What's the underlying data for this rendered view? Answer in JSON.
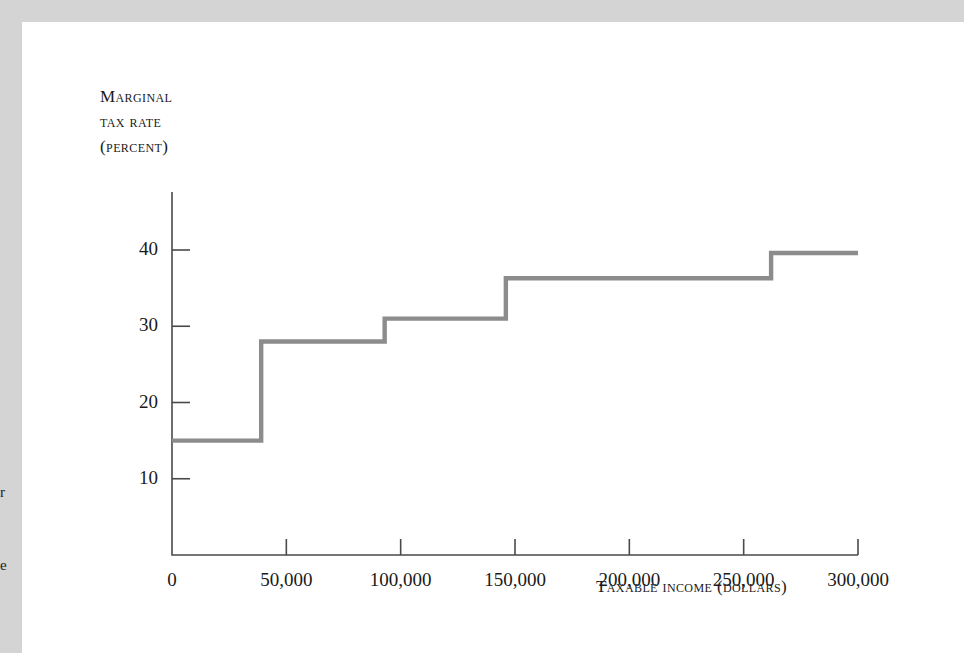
{
  "figure": {
    "background_color": "#ffffff",
    "margin_color": "#d4d4d4",
    "line_color": "#8c8c8c",
    "axis_color": "#4a4a4a"
  },
  "margin_fragments": {
    "fragment_one": "r",
    "fragment_two": "e"
  },
  "chart_data": {
    "type": "line",
    "line_style": "step-post",
    "title": "",
    "xlabel": "Taxable income (dollars)",
    "ylabel": "Marginal tax rate (percent)",
    "ylabel_lines": [
      "Marginal",
      "tax rate",
      "(percent)"
    ],
    "xlim": [
      0,
      300000
    ],
    "ylim": [
      0,
      42
    ],
    "grid": false,
    "legend": null,
    "xticks": [
      0,
      50000,
      100000,
      150000,
      200000,
      250000,
      300000
    ],
    "xtick_labels": [
      "0",
      "50,000",
      "100,000",
      "150,000",
      "200,000",
      "250,000",
      "300,000"
    ],
    "yticks": [
      10,
      20,
      30,
      40
    ],
    "ytick_labels": [
      "10",
      "20",
      "30",
      "40"
    ],
    "x": [
      0,
      39000,
      39000,
      93000,
      93000,
      146000,
      146000,
      262000,
      262000,
      300000
    ],
    "y": [
      15,
      15,
      28,
      28,
      31,
      31,
      36.3,
      36.3,
      39.6,
      39.6
    ],
    "brackets": [
      {
        "lower": 0,
        "upper": 39000,
        "rate": 15
      },
      {
        "lower": 39000,
        "upper": 93000,
        "rate": 28
      },
      {
        "lower": 93000,
        "upper": 146000,
        "rate": 31
      },
      {
        "lower": 146000,
        "upper": 262000,
        "rate": 36.3
      },
      {
        "lower": 262000,
        "upper": 300000,
        "rate": 39.6
      }
    ]
  }
}
